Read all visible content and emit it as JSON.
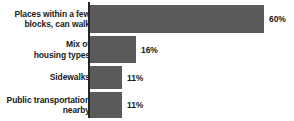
{
  "chart_data": {
    "type": "bar",
    "orientation": "horizontal",
    "title": "",
    "subtitle": "",
    "xlabel": "",
    "ylabel": "",
    "grid": false,
    "legend": null,
    "xlim": [
      0,
      60
    ],
    "axis_line": true,
    "bar_color": "#5a5a5a",
    "text_color": "#1a1a1a",
    "background": "#ffffff",
    "categories": [
      "Places within a few blocks, can walk",
      "Mix of housing types",
      "Sidewalks",
      "Public transportation nearby"
    ],
    "values": [
      60,
      16,
      11,
      11
    ],
    "value_labels": [
      "60%",
      "16%",
      "11%",
      "11%"
    ],
    "bars": [
      {
        "label_line1": "Places within a few",
        "label_line2": "blocks, can walk",
        "label": "Places within a few\nblocks, can walk",
        "value": 60,
        "value_label": "60%"
      },
      {
        "label_line1": "Mix of",
        "label_line2": "housing types",
        "label": "Mix of\nhousing types",
        "value": 16,
        "value_label": "16%"
      },
      {
        "label_line1": "Sidewalks",
        "label_line2": "",
        "label": "Sidewalks",
        "value": 11,
        "value_label": "11%"
      },
      {
        "label_line1": "Public transportation",
        "label_line2": "nearby",
        "label": "Public transportation\nnearby",
        "value": 11,
        "value_label": "11%"
      }
    ]
  },
  "layout": {
    "width": 294,
    "height": 121,
    "axis_x": 88,
    "bar_start_x": 90,
    "max_bar_width": 174,
    "rows": [
      {
        "top": 5,
        "height": 28
      },
      {
        "top": 36,
        "height": 27
      },
      {
        "top": 66,
        "height": 23
      },
      {
        "top": 92,
        "height": 26
      }
    ]
  }
}
